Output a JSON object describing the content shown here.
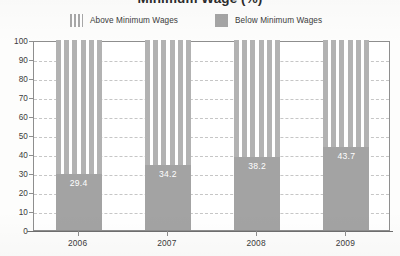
{
  "chart_data": {
    "type": "bar",
    "subtype": "stacked-100-percent",
    "title": "Minimum Wage (%)",
    "xlabel": "",
    "ylabel": "",
    "ylim": [
      0,
      100
    ],
    "ytick_step": 10,
    "yticks": [
      0,
      10,
      20,
      30,
      40,
      50,
      60,
      70,
      80,
      90,
      100
    ],
    "ytick_labels": [
      "0",
      "10",
      "20",
      "30",
      "40",
      "50",
      "60",
      "70",
      "80",
      "90",
      "100"
    ],
    "grid": true,
    "grid_style": "dashed-horizontal",
    "legend_position": "top",
    "categories": [
      "2006",
      "2007",
      "2008",
      "2009"
    ],
    "series": [
      {
        "name": "Above Minimum Wages",
        "fill": "vertical-stripes",
        "color": "#b2b2b2",
        "values": [
          70.6,
          65.8,
          61.8,
          56.3
        ],
        "labels": [
          "",
          "",
          "",
          ""
        ]
      },
      {
        "name": "Below Minimum Wages",
        "fill": "solid",
        "color": "#a3a3a3",
        "values": [
          29.4,
          34.2,
          38.2,
          43.7
        ],
        "labels": [
          "29.4",
          "34.2",
          "38.2",
          "43.7"
        ]
      }
    ]
  },
  "title": {
    "text": "Minimum Wage (%)"
  },
  "legend": {
    "items": [
      {
        "label": "Above Minimum Wages",
        "swatch": "striped-swatch"
      },
      {
        "label": "Below Minimum Wages",
        "swatch": "solid-swatch"
      }
    ]
  },
  "axes": {
    "y": {
      "labels": [
        "100",
        "90",
        "80",
        "70",
        "60",
        "50",
        "40",
        "30",
        "20",
        "10",
        "0"
      ]
    },
    "x": {
      "labels": [
        "2006",
        "2007",
        "2008",
        "2009"
      ]
    }
  },
  "bars": [
    {
      "category": "2006",
      "below": 29.4,
      "above": 70.6,
      "below_label": "29.4"
    },
    {
      "category": "2007",
      "below": 34.2,
      "above": 65.8,
      "below_label": "34.2"
    },
    {
      "category": "2008",
      "below": 38.2,
      "above": 61.8,
      "below_label": "38.2"
    },
    {
      "category": "2009",
      "below": 43.7,
      "above": 56.3,
      "below_label": "43.7"
    }
  ],
  "colors": {
    "below_fill": "#a3a3a3",
    "above_stripe": "#b2b2b2",
    "axis": "#8e8e8e",
    "grid": "#c6c6c6",
    "text": "#3b3b3b",
    "value_label": "#ffffff"
  }
}
